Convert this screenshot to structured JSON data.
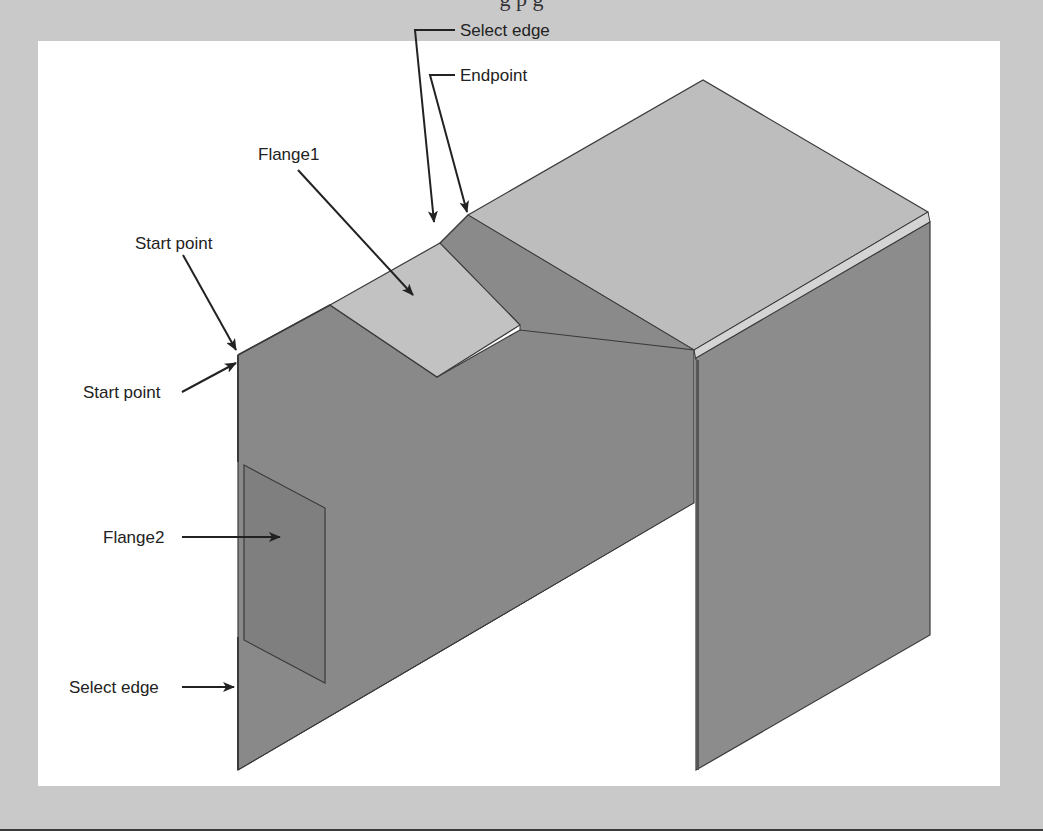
{
  "figure": {
    "caption_partial": "g          p g",
    "labels": {
      "select_edge_top": "Select edge",
      "endpoint": "Endpoint",
      "flange1": "Flange1",
      "start_point_top": "Start point",
      "start_point_left": "Start point",
      "flange2": "Flange2",
      "select_edge_bottom": "Select edge"
    },
    "colors": {
      "background": "#c9c9c9",
      "panel": "#ffffff",
      "face_dark": "#8a8a8a",
      "face_light": "#bdbdbd",
      "edge": "#3a3a3a",
      "text": "#222222"
    }
  }
}
